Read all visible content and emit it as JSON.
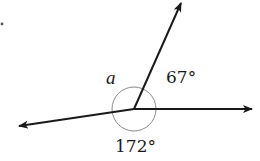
{
  "diagram": {
    "type": "angle-diagram",
    "vertex": {
      "x": 134,
      "y": 109
    },
    "rays": [
      {
        "name": "left-ray",
        "tip": {
          "x": 19,
          "y": 126
        }
      },
      {
        "name": "right-ray",
        "tip": {
          "x": 252,
          "y": 109
        }
      },
      {
        "name": "upper-ray",
        "tip": {
          "x": 181,
          "y": 3
        }
      }
    ],
    "arc": {
      "radius": 22,
      "color": "#8a8a8a"
    },
    "line_color": "#1a1a1a",
    "labels": {
      "unknown_angle": "a",
      "angle_upper_right": "67°",
      "angle_bottom": "172°"
    }
  }
}
